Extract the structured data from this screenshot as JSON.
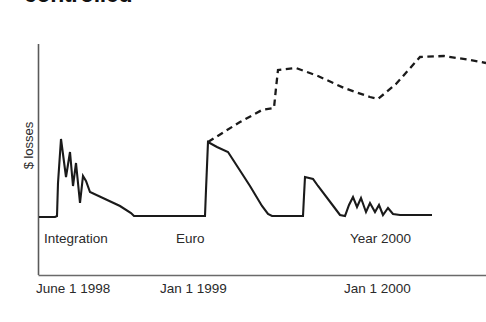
{
  "title": "controlled",
  "y_axis": {
    "label": "$ losses"
  },
  "x_axis": {
    "ticks": [
      {
        "label": "June 1 1998",
        "x": 60
      },
      {
        "label": "Jan 1 1999",
        "x": 190
      },
      {
        "label": "Jan 1 2000",
        "x": 380
      }
    ]
  },
  "annotations": [
    {
      "name": "integration",
      "label": "Integration"
    },
    {
      "name": "euro",
      "label": "Euro"
    },
    {
      "name": "year-2000",
      "label": "Year 2000"
    }
  ],
  "colors": {
    "ink": "#1a1a1a",
    "axis": "#4a4a4a",
    "series_actual": "#1a1a1a",
    "series_projected": "#1a1a1a",
    "background": "#ffffff"
  },
  "chart_data": {
    "type": "line",
    "title": "controlled",
    "xlabel": "",
    "ylabel": "$ losses",
    "grid": false,
    "legend": "none",
    "axis_pixel_frame": {
      "x0": 38,
      "x1": 486,
      "y_top": 44,
      "y_baseline": 217,
      "y_axis_bottom": 275
    },
    "xlim_labels": [
      "June 1 1998",
      "Jan 1 1999",
      "Jan 1 2000"
    ],
    "series": [
      {
        "name": "Actual losses",
        "style": "solid",
        "points_px": [
          [
            39,
            217
          ],
          [
            55,
            217
          ],
          [
            57,
            216
          ],
          [
            58,
            183
          ],
          [
            61,
            139
          ],
          [
            66,
            177
          ],
          [
            70,
            152
          ],
          [
            73,
            186
          ],
          [
            76,
            163
          ],
          [
            80,
            203
          ],
          [
            83,
            176
          ],
          [
            86,
            181
          ],
          [
            90,
            192
          ],
          [
            120,
            206
          ],
          [
            131,
            213
          ],
          [
            134,
            216
          ],
          [
            158,
            216
          ],
          [
            200,
            216
          ],
          [
            205,
            216
          ],
          [
            206,
            190
          ],
          [
            208,
            142
          ],
          [
            217,
            147
          ],
          [
            228,
            152
          ],
          [
            250,
            186
          ],
          [
            262,
            206
          ],
          [
            268,
            214
          ],
          [
            272,
            216
          ],
          [
            300,
            216
          ],
          [
            303,
            216
          ],
          [
            304,
            196
          ],
          [
            305,
            177
          ],
          [
            313,
            179
          ],
          [
            318,
            186
          ],
          [
            334,
            207
          ],
          [
            340,
            215
          ],
          [
            345,
            216
          ],
          [
            349,
            205
          ],
          [
            353,
            197
          ],
          [
            357,
            207
          ],
          [
            361,
            198
          ],
          [
            366,
            212
          ],
          [
            370,
            203
          ],
          [
            375,
            212
          ],
          [
            379,
            205
          ],
          [
            383,
            215
          ],
          [
            388,
            208
          ],
          [
            393,
            214
          ],
          [
            400,
            215
          ],
          [
            415,
            215
          ],
          [
            432,
            215
          ]
        ],
        "description": "Three loss spikes: Integration (mid-1998, tallest, jagged decay), Euro (Jan 1999, tall, long smooth decline), Year 2000 (late 1999, smaller, sawtooth decay to baseline)"
      },
      {
        "name": "Projected losses",
        "style": "dashed",
        "points_px": [
          [
            208,
            142
          ],
          [
            240,
            122
          ],
          [
            262,
            110
          ],
          [
            274,
            108
          ],
          [
            276,
            88
          ],
          [
            278,
            70
          ],
          [
            296,
            68
          ],
          [
            318,
            76
          ],
          [
            344,
            88
          ],
          [
            370,
            97
          ],
          [
            378,
            99
          ],
          [
            396,
            84
          ],
          [
            412,
            66
          ],
          [
            420,
            57
          ],
          [
            444,
            56
          ],
          [
            470,
            60
          ],
          [
            486,
            63
          ]
        ],
        "description": "Dashed projection branching upward from the Euro peak: climbs to a high plateau, dips, then rises again toward the right edge"
      }
    ]
  }
}
